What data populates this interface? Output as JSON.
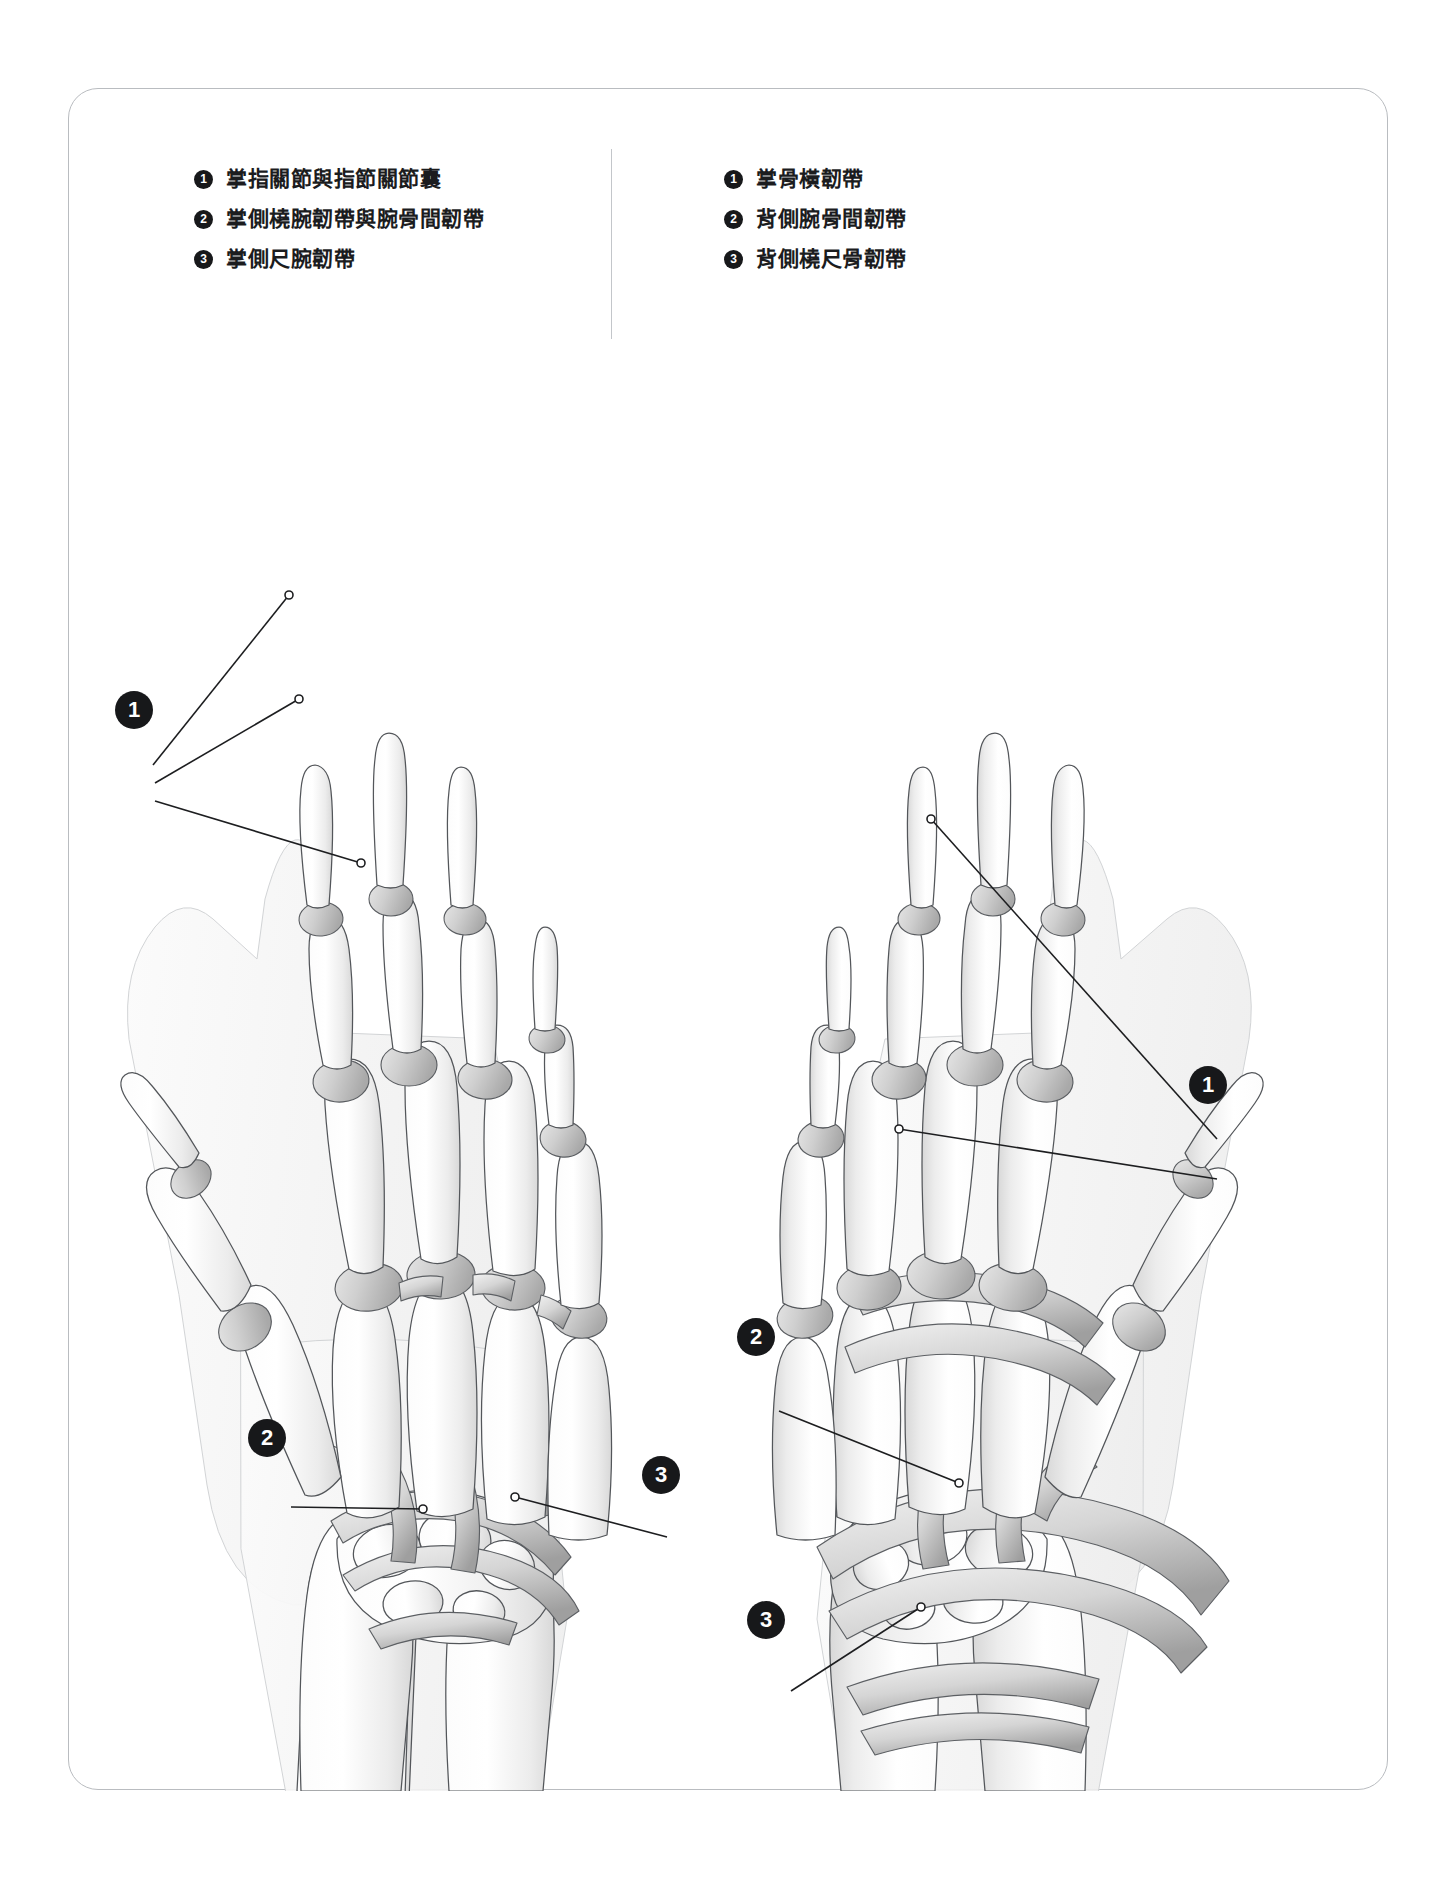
{
  "plate": {
    "border_color": "#b9bcc0",
    "background": "#ffffff",
    "marker_color": "#17181a",
    "marker_text_color": "#ffffff",
    "leader_line_color": "#1d1e20",
    "divider_color": "#c3c6ca"
  },
  "legend": {
    "palmar": {
      "items": [
        {
          "number": "1",
          "label": "掌指關節與指節關節囊"
        },
        {
          "number": "2",
          "label": "掌側橈腕韌帶與腕骨間韌帶"
        },
        {
          "number": "3",
          "label": "掌側尺腕韌帶"
        }
      ]
    },
    "dorsal": {
      "items": [
        {
          "number": "1",
          "label": "掌骨橫韌帶"
        },
        {
          "number": "2",
          "label": "背側腕骨間韌帶"
        },
        {
          "number": "3",
          "label": "背側橈尺骨韌帶"
        }
      ]
    }
  },
  "figures": {
    "palmar_view": {
      "name": "left-hand-palmar-view",
      "callouts": [
        {
          "number": "1",
          "x": 133,
          "y": 690
        },
        {
          "number": "2",
          "x": 266,
          "y": 1418
        },
        {
          "number": "3",
          "x": 660,
          "y": 1455
        }
      ]
    },
    "dorsal_view": {
      "name": "right-hand-dorsal-view",
      "callouts": [
        {
          "number": "1",
          "x": 1207,
          "y": 1065
        },
        {
          "number": "2",
          "x": 755,
          "y": 1317
        },
        {
          "number": "3",
          "x": 765,
          "y": 1600
        }
      ]
    }
  }
}
